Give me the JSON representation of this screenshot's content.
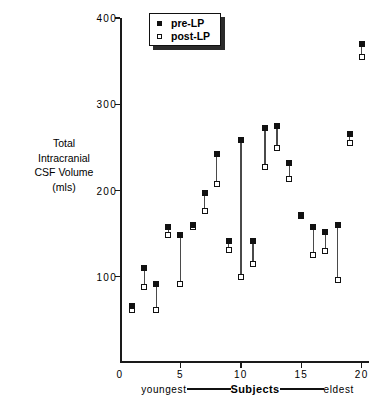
{
  "chart_data": {
    "type": "scatter",
    "title": "",
    "xlabel": "Subjects",
    "ylabel": "Total Intracranial CSF Volume (mls)",
    "ylabel_lines": [
      "Total",
      "Intracranial",
      "CSF  Volume",
      "(mls)"
    ],
    "xlim": [
      0,
      20.6
    ],
    "ylim": [
      0,
      400
    ],
    "yticks": [
      100,
      200,
      300,
      400
    ],
    "ytick_labels": [
      "100",
      "200",
      "300",
      "400"
    ],
    "xticks": [
      0,
      5,
      10,
      15,
      20
    ],
    "xtick_labels": [
      "0",
      "5",
      "10",
      "15",
      "20"
    ],
    "grid": false,
    "legend_position": "top-left",
    "legend": [
      {
        "name": "pre-LP",
        "marker": "filled-square",
        "color": "#111111"
      },
      {
        "name": "post-LP",
        "marker": "open-square",
        "color": "#ffffff"
      }
    ],
    "x_axis_annotation": {
      "left": "youngest",
      "center": "Subjects",
      "right": "eldest"
    },
    "series": [
      {
        "name": "pre-LP",
        "values": [
          66,
          110,
          92,
          158,
          148,
          160,
          197,
          242,
          141,
          258,
          142,
          272,
          275,
          232,
          172,
          158,
          152,
          160,
          265,
          370
        ]
      },
      {
        "name": "post-LP",
        "values": [
          62,
          88,
          62,
          148,
          92,
          158,
          176,
          207,
          131,
          100,
          115,
          227,
          249,
          213,
          170,
          125,
          130,
          96,
          255,
          355
        ]
      }
    ],
    "x": [
      1,
      2,
      3,
      4,
      5,
      6,
      7,
      8,
      9,
      10,
      11,
      12,
      13,
      14,
      15,
      16,
      17,
      18,
      19,
      20
    ],
    "points": [
      {
        "subject": 1,
        "pre": 66,
        "post": 62
      },
      {
        "subject": 2,
        "pre": 110,
        "post": 88
      },
      {
        "subject": 3,
        "pre": 92,
        "post": 62
      },
      {
        "subject": 4,
        "pre": 158,
        "post": 148
      },
      {
        "subject": 5,
        "pre": 148,
        "post": 92
      },
      {
        "subject": 6,
        "pre": 160,
        "post": 158
      },
      {
        "subject": 7,
        "pre": 197,
        "post": 176
      },
      {
        "subject": 8,
        "pre": 242,
        "post": 207
      },
      {
        "subject": 9,
        "pre": 141,
        "post": 131
      },
      {
        "subject": 10,
        "pre": 258,
        "post": 100
      },
      {
        "subject": 11,
        "pre": 142,
        "post": 115
      },
      {
        "subject": 12,
        "pre": 272,
        "post": 227
      },
      {
        "subject": 13,
        "pre": 275,
        "post": 249
      },
      {
        "subject": 14,
        "pre": 232,
        "post": 213
      },
      {
        "subject": 15,
        "pre": 172,
        "post": 170
      },
      {
        "subject": 16,
        "pre": 158,
        "post": 125
      },
      {
        "subject": 17,
        "pre": 152,
        "post": 130
      },
      {
        "subject": 18,
        "pre": 160,
        "post": 96
      },
      {
        "subject": 19,
        "pre": 265,
        "post": 255
      },
      {
        "subject": 20,
        "pre": 370,
        "post": 355
      }
    ]
  }
}
